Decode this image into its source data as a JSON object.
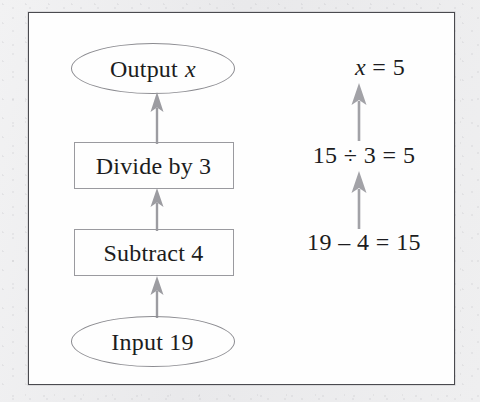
{
  "figure": {
    "type": "flowchart",
    "border_color": "#4a4a4f",
    "shape_outline_color": "#8b8b90",
    "arrow_color": "#9c9ca1",
    "text_color": "#1c1c20",
    "page_background": "#ededee",
    "figure_background": "#fefefe"
  },
  "flowchart": {
    "nodes": [
      {
        "id": "input",
        "shape": "ellipse",
        "label_prefix": "Input 19",
        "label_italic": ""
      },
      {
        "id": "subtract",
        "shape": "rect",
        "label_prefix": "Subtract 4",
        "label_italic": ""
      },
      {
        "id": "divide",
        "shape": "rect",
        "label_prefix": "Divide by 3",
        "label_italic": ""
      },
      {
        "id": "output",
        "shape": "ellipse",
        "label_prefix": "Output ",
        "label_italic": "x"
      }
    ],
    "arrows": [
      {
        "id": "flow-arrow-1",
        "from": "input",
        "to": "subtract",
        "direction": "up"
      },
      {
        "id": "flow-arrow-2",
        "from": "subtract",
        "to": "divide",
        "direction": "up"
      },
      {
        "id": "flow-arrow-3",
        "from": "divide",
        "to": "output",
        "direction": "up"
      }
    ]
  },
  "calculations": {
    "steps": [
      {
        "id": "subtract",
        "text": "19 – 4 = 15"
      },
      {
        "id": "divide",
        "text": "15 ÷ 3 = 5"
      }
    ],
    "result": {
      "variable": "x",
      "equals": " = 5"
    },
    "arrows": [
      {
        "id": "calc-arrow-1",
        "from": "subtract",
        "to": "divide",
        "direction": "up"
      },
      {
        "id": "calc-arrow-2",
        "from": "divide",
        "to": "result",
        "direction": "up"
      }
    ]
  }
}
